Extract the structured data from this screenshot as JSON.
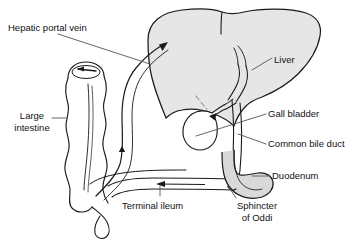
{
  "diagram": {
    "background_color": "#ffffff",
    "stroke_color": "#1a1a1a",
    "organ_fill_color": "#e6e6e6",
    "leader_color": "#555555",
    "labels": [
      {
        "id": "hepatic-portal-vein",
        "text": "Hepatic portal vein",
        "x": 8,
        "y": 22,
        "align": "left"
      },
      {
        "id": "liver",
        "text": "Liver",
        "x": 274,
        "y": 54,
        "align": "left"
      },
      {
        "id": "large-intestine",
        "line1": "Large",
        "line2": "intestine",
        "x": 10,
        "y": 112,
        "align": "center"
      },
      {
        "id": "gall-bladder",
        "text": "Gall bladder",
        "x": 268,
        "y": 112,
        "align": "left"
      },
      {
        "id": "common-bile-duct",
        "text": "Common bile duct",
        "x": 268,
        "y": 142,
        "align": "left"
      },
      {
        "id": "duodenum",
        "text": "Duodenum",
        "x": 272,
        "y": 172,
        "align": "left"
      },
      {
        "id": "terminal-ileum",
        "text": "Terminal ileum",
        "x": 122,
        "y": 199,
        "align": "left"
      },
      {
        "id": "sphincter-of-oddi",
        "line1": "Sphincter",
        "line2": "of Oddi",
        "x": 228,
        "y": 199,
        "align": "center"
      }
    ],
    "structures": [
      {
        "id": "liver-body",
        "name": "Liver",
        "fill": "#e6e6e6"
      },
      {
        "id": "gall-bladder-body",
        "name": "Gall bladder",
        "fill": "#ffffff"
      },
      {
        "id": "duodenum-body",
        "name": "Duodenum",
        "fill": "#d9d9d9"
      },
      {
        "id": "large-intestine-body",
        "name": "Large intestine / ascending colon",
        "fill": "#ffffff"
      },
      {
        "id": "terminal-ileum-body",
        "name": "Terminal ileum",
        "fill": "#ffffff"
      },
      {
        "id": "portal-vein-vessel",
        "name": "Hepatic portal vein",
        "fill": "none"
      },
      {
        "id": "common-bile-duct-vessel",
        "name": "Common bile duct",
        "fill": "none"
      },
      {
        "id": "cystic-duct-vessel",
        "name": "Cystic duct",
        "fill": "none"
      }
    ],
    "flow_arrows": [
      {
        "id": "arrow-portal-into-liver",
        "direction": "up-right",
        "description": "blood flow into liver"
      },
      {
        "id": "arrow-portal-ascending",
        "direction": "up",
        "description": "blood flow up portal vein"
      },
      {
        "id": "arrow-ileum-flow",
        "direction": "left",
        "description": "flow along terminal ileum"
      },
      {
        "id": "arrow-colon-flow",
        "direction": "left",
        "description": "flow in ascending colon"
      },
      {
        "id": "arrow-bile-into-gallbladder",
        "direction": "left",
        "description": "bile into gall bladder"
      }
    ]
  }
}
